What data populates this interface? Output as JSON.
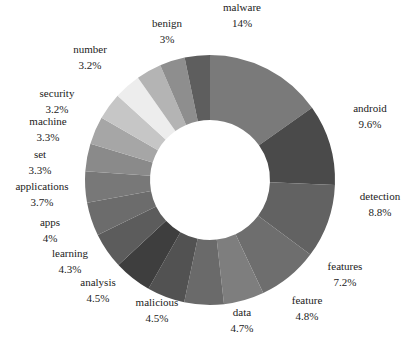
{
  "chart_data": {
    "type": "pie",
    "variant": "donut",
    "title": "",
    "center": [
      210,
      180
    ],
    "outer_radius": 125,
    "inner_radius": 60,
    "start_angle_deg": 0,
    "direction": "clockwise",
    "slices": [
      {
        "label": "malware",
        "pct_label": "14%",
        "value": 14.0,
        "color": "#7a7a7a",
        "lx": 242,
        "ly": 15
      },
      {
        "label": "android",
        "pct_label": "9.6%",
        "value": 9.6,
        "color": "#4a4a4a",
        "lx": 370,
        "ly": 116
      },
      {
        "label": "detection",
        "pct_label": "8.8%",
        "value": 8.8,
        "color": "#626262",
        "lx": 380,
        "ly": 204
      },
      {
        "label": "features",
        "pct_label": "7.2%",
        "value": 7.2,
        "color": "#6e6e6e",
        "lx": 345,
        "ly": 274
      },
      {
        "label": "feature",
        "pct_label": "4.8%",
        "value": 4.8,
        "color": "#7e7e7e",
        "lx": 307,
        "ly": 308
      },
      {
        "label": "data",
        "pct_label": "4.7%",
        "value": 4.7,
        "color": "#6a6a6a",
        "lx": 242,
        "ly": 320
      },
      {
        "label": "malicious",
        "pct_label": "4.5%",
        "value": 4.5,
        "color": "#525252",
        "lx": 157,
        "ly": 310
      },
      {
        "label": "analysis",
        "pct_label": "4.5%",
        "value": 4.5,
        "color": "#3e3e3e",
        "lx": 98,
        "ly": 290
      },
      {
        "label": "learning",
        "pct_label": "4.3%",
        "value": 4.3,
        "color": "#5c5c5c",
        "lx": 70,
        "ly": 261
      },
      {
        "label": "apps",
        "pct_label": "4%",
        "value": 4.0,
        "color": "#6c6c6c",
        "lx": 50,
        "ly": 230
      },
      {
        "label": "applications",
        "pct_label": "3.7%",
        "value": 3.7,
        "color": "#787878",
        "lx": 42,
        "ly": 194
      },
      {
        "label": "set",
        "pct_label": "3.3%",
        "value": 3.3,
        "color": "#8a8a8a",
        "lx": 40,
        "ly": 162
      },
      {
        "label": "machine",
        "pct_label": "3.3%",
        "value": 3.3,
        "color": "#a6a6a6",
        "lx": 48,
        "ly": 129
      },
      {
        "label": "security",
        "pct_label": "3.2%",
        "value": 3.2,
        "color": "#c6c6c6",
        "lx": 57,
        "ly": 101
      },
      {
        "label": "number",
        "pct_label": "3.2%",
        "value": 3.2,
        "color": "#ededed",
        "lx": 90,
        "ly": 57
      },
      {
        "label": "",
        "pct_label": "",
        "value": 3.0,
        "color": "#b4b4b4",
        "lx": 0,
        "ly": 0
      },
      {
        "label": "benign",
        "pct_label": "3%",
        "value": 3.0,
        "color": "#8e8e8e",
        "lx": 167,
        "ly": 31
      },
      {
        "label": "",
        "pct_label": "",
        "value": 3.0,
        "color": "#5e5e5e",
        "lx": 0,
        "ly": 0
      }
    ]
  }
}
